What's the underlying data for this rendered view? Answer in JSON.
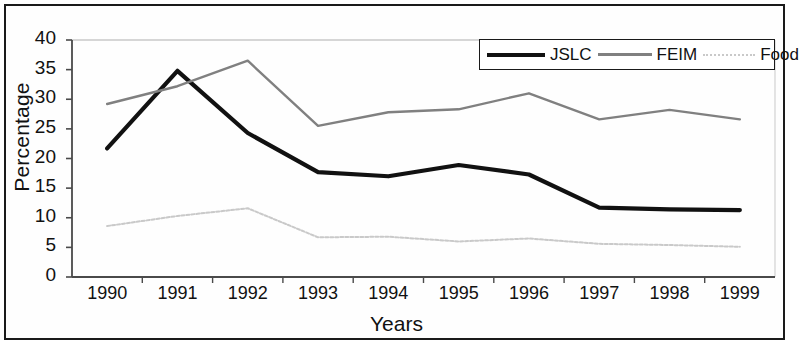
{
  "axes": {
    "ylabel": "Percentage",
    "xlabel": "Years",
    "yticks": [
      "0",
      "5",
      "10",
      "15",
      "20",
      "25",
      "30",
      "35",
      "40"
    ],
    "xticks": [
      "1990",
      "1991",
      "1992",
      "1993",
      "1994",
      "1995",
      "1996",
      "1997",
      "1998",
      "1999"
    ]
  },
  "legend": {
    "jslc": "JSLC",
    "feim": "FEIM",
    "food": "Food"
  },
  "colors": {
    "jslc": "#111111",
    "feim": "#808080",
    "food": "#c9c9c9",
    "axis": "#4a4a4a",
    "border": "#1a1a1a"
  },
  "chart_data": {
    "type": "line",
    "title": "",
    "xlabel": "Years",
    "ylabel": "Percentage",
    "categories": [
      "1990",
      "1991",
      "1992",
      "1993",
      "1994",
      "1995",
      "1996",
      "1997",
      "1998",
      "1999"
    ],
    "ylim": [
      0,
      40
    ],
    "yticks": [
      0,
      5,
      10,
      15,
      20,
      25,
      30,
      35,
      40
    ],
    "grid": false,
    "legend_position": "top-right",
    "series": [
      {
        "name": "JSLC",
        "color": "#111111",
        "values": [
          21.7,
          34.8,
          24.3,
          17.7,
          17.0,
          18.9,
          17.3,
          11.7,
          11.4,
          11.3
        ]
      },
      {
        "name": "FEIM",
        "color": "#808080",
        "values": [
          29.2,
          32.2,
          36.5,
          25.5,
          27.8,
          28.3,
          31.0,
          26.6,
          28.2,
          26.6
        ]
      },
      {
        "name": "Food",
        "color": "#c9c9c9",
        "values": [
          8.6,
          10.3,
          11.6,
          6.7,
          6.8,
          6.0,
          6.5,
          5.6,
          5.4,
          5.1
        ]
      }
    ]
  }
}
